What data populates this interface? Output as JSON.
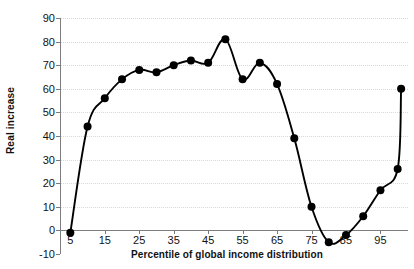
{
  "chart_data": {
    "type": "line",
    "title": "",
    "xlabel": "Percentile of global income distribution",
    "ylabel": "Real increase",
    "xlim": [
      2,
      103
    ],
    "ylim": [
      -10,
      90
    ],
    "grid": true,
    "legend": "none",
    "marker": "filled-circle",
    "x_ticks": [
      5,
      15,
      25,
      35,
      45,
      55,
      65,
      75,
      85,
      95
    ],
    "x_tick_labels": [
      "5",
      "15",
      "25",
      "35",
      "45",
      "55",
      "65",
      "75",
      "85",
      "95"
    ],
    "y_ticks": [
      -10,
      0,
      10,
      20,
      30,
      40,
      50,
      60,
      70,
      80,
      90
    ],
    "y_tick_labels": [
      "-10",
      "0",
      "10",
      "20",
      "30",
      "40",
      "50",
      "60",
      "70",
      "80",
      "90"
    ],
    "series": [
      {
        "name": "Real increase",
        "x": [
          5,
          10,
          15,
          20,
          25,
          30,
          35,
          40,
          45,
          50,
          55,
          60,
          65,
          70,
          75,
          80,
          85,
          90,
          95,
          100,
          101
        ],
        "values": [
          -1,
          44,
          56,
          64,
          68,
          67,
          70,
          72,
          71,
          81,
          64,
          71,
          62,
          39,
          10,
          -5,
          -2,
          6,
          17,
          26,
          60
        ]
      }
    ],
    "colors": {
      "line": "#000000",
      "marker": "#000000",
      "grid": "#d8d8dd",
      "axis": "#7e7e82",
      "text": "#111111",
      "background": "#ffffff"
    }
  }
}
